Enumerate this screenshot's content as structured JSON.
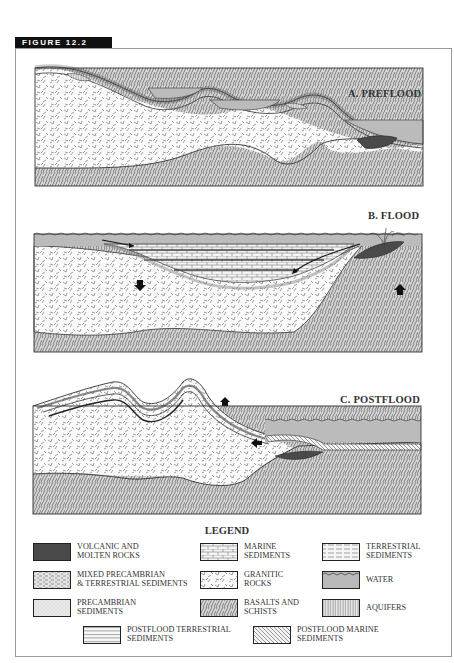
{
  "figure": {
    "tab_label": "FIGURE 12.2"
  },
  "panels": [
    {
      "id": "A",
      "label": "A. PREFLOOD"
    },
    {
      "id": "B",
      "label": "B. FLOOD"
    },
    {
      "id": "C",
      "label": "C. POSTFLOOD"
    }
  ],
  "legend": {
    "title": "LEGEND",
    "items": [
      {
        "key": "volcanic",
        "line1": "Volcanic and",
        "line2": "Molten Rocks"
      },
      {
        "key": "marine",
        "line1": "Marine",
        "line2": "Sediments"
      },
      {
        "key": "terrestrial",
        "line1": "Terrestrial",
        "line2": "Sediments"
      },
      {
        "key": "mixed",
        "line1": "Mixed Precambrian",
        "line2": "& Terrestrial Sediments"
      },
      {
        "key": "granitic",
        "line1": "Granitic",
        "line2": "Rocks"
      },
      {
        "key": "water",
        "line1": "Water",
        "line2": ""
      },
      {
        "key": "precambrian",
        "line1": "Precambrian",
        "line2": "Sediments"
      },
      {
        "key": "basalts",
        "line1": "Basalts and",
        "line2": "Schists"
      },
      {
        "key": "aquifers",
        "line1": "Aquifers",
        "line2": ""
      },
      {
        "key": "postflood_terrestrial",
        "line1": "Postflood Terrestrial",
        "line2": "Sediments"
      },
      {
        "key": "postflood_marine",
        "line1": "Postflood Marine",
        "line2": "Sediments"
      }
    ]
  },
  "colors": {
    "tab_bg": "#111111",
    "frame": "#9a9a9a",
    "water": "#b9b9b9",
    "volcanic": "#4a4a4a",
    "precambrian": "#e6e6e6",
    "granitic_bg": "#fafafa",
    "basalt_bg": "#d8d8d8",
    "outline": "#333333"
  }
}
